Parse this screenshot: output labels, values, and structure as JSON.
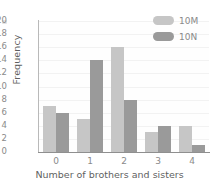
{
  "chart_data": {
    "type": "bar",
    "title": "",
    "subtitle": "",
    "xlabel": "Number of brothers and sisters",
    "ylabel": "Frequency",
    "categories": [
      "0",
      "1",
      "2",
      "3",
      "4"
    ],
    "series": [
      {
        "name": "10M",
        "color": "#c6c6c6",
        "values": [
          7,
          5,
          16,
          3,
          4
        ]
      },
      {
        "name": "10N",
        "color": "#9a9a9a",
        "values": [
          6,
          14,
          8,
          4,
          1
        ]
      }
    ],
    "ylim": [
      0,
      20
    ],
    "ytick_step": 2,
    "yticks": [
      "20",
      "18",
      "16",
      "14",
      "12",
      "10",
      "8",
      "6",
      "4",
      "2",
      "0"
    ],
    "grid": true,
    "grid_axis": "y",
    "legend_position": "top-right",
    "background_color": "#ffffff"
  }
}
